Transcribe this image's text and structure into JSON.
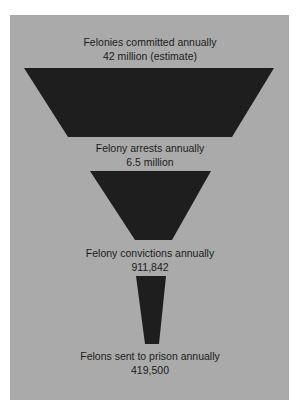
{
  "colors": {
    "background": "#ffffff",
    "panel": "#aaaaaa",
    "shape_fill": "#1e1e1e",
    "text": "#1c1c1c"
  },
  "stages": [
    {
      "title": "Felonies committed annually",
      "value": "42 million (estimate)"
    },
    {
      "title": "Felony arrests annually",
      "value": "6.5 million"
    },
    {
      "title": "Felony convictions annually",
      "value": "911,842"
    },
    {
      "title": "Felons sent to prison annually",
      "value": "419,500"
    }
  ]
}
